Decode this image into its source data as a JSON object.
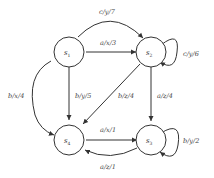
{
  "diagram": {
    "type": "finite-state-machine",
    "states": [
      {
        "id": "s1",
        "name": "s",
        "sub": "1"
      },
      {
        "id": "s2",
        "name": "s",
        "sub": "2"
      },
      {
        "id": "s3",
        "name": "s",
        "sub": "3"
      },
      {
        "id": "s4",
        "name": "s",
        "sub": "4"
      }
    ],
    "edges": [
      {
        "from": "s1",
        "to": "s2",
        "label": "c/y/7"
      },
      {
        "from": "s1",
        "to": "s2",
        "label": "a/x/3"
      },
      {
        "from": "s2",
        "to": "s2",
        "label": "c/y/6"
      },
      {
        "from": "s1",
        "to": "s4",
        "label": "b/x/4"
      },
      {
        "from": "s1",
        "to": "s4",
        "label": "b/y/5"
      },
      {
        "from": "s2",
        "to": "s4",
        "label": "b/z/4"
      },
      {
        "from": "s2",
        "to": "s3",
        "label": "a/z/4"
      },
      {
        "from": "s4",
        "to": "s3",
        "label": "a/x/1"
      },
      {
        "from": "s3",
        "to": "s4",
        "label": "a/z/1"
      },
      {
        "from": "s3",
        "to": "s3",
        "label": "b/y/2"
      }
    ]
  }
}
